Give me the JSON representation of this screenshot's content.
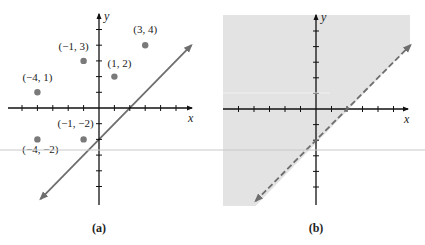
{
  "chart_data": [
    {
      "type": "scatter",
      "panel_label": "(a)",
      "xlabel": "x",
      "ylabel": "y",
      "xlim": [
        -6,
        6
      ],
      "ylim": [
        -6,
        6
      ],
      "ticks_x": [
        -5,
        -4,
        -3,
        -2,
        -1,
        1,
        2,
        3,
        4,
        5
      ],
      "ticks_y": [
        -5,
        -4,
        -3,
        -2,
        -1,
        1,
        2,
        3,
        4,
        5
      ],
      "grid": false,
      "points": [
        {
          "x": -4,
          "y": 1,
          "label": "(−4, 1)"
        },
        {
          "x": -1,
          "y": 3,
          "label": "(−1, 3)"
        },
        {
          "x": 1,
          "y": 2,
          "label": "(1, 2)"
        },
        {
          "x": 3,
          "y": 4,
          "label": "(3, 4)"
        },
        {
          "x": -1,
          "y": -2,
          "label": "(−1, −2)"
        },
        {
          "x": -4,
          "y": -2,
          "label": "(−4, −2)"
        }
      ],
      "line": {
        "equation": "y = x - 2",
        "slope": 1,
        "intercept": -2,
        "style": "solid",
        "x_range": [
          -3.8,
          6.0
        ]
      }
    },
    {
      "type": "area",
      "panel_label": "(b)",
      "xlabel": "x",
      "ylabel": "y",
      "xlim": [
        -6,
        6
      ],
      "ylim": [
        -6,
        6
      ],
      "ticks_x": [
        -5,
        -4,
        -3,
        -2,
        -1,
        1,
        2,
        3,
        4,
        5
      ],
      "ticks_y": [
        -5,
        -4,
        -3,
        -2,
        -1,
        1,
        2,
        3,
        4,
        5
      ],
      "grid": false,
      "inequality": "y > x - 2",
      "shaded_region": "above boundary line",
      "line": {
        "equation": "y = x - 2",
        "slope": 1,
        "intercept": -2,
        "style": "dashed",
        "x_range": [
          -3.9,
          6.1
        ]
      }
    }
  ],
  "colors": {
    "axis": "#111111",
    "line": "#6e6e6e",
    "point": "#7a7a7a",
    "shade": "#e3e3e3",
    "scan_line": "#c8c8c8"
  }
}
